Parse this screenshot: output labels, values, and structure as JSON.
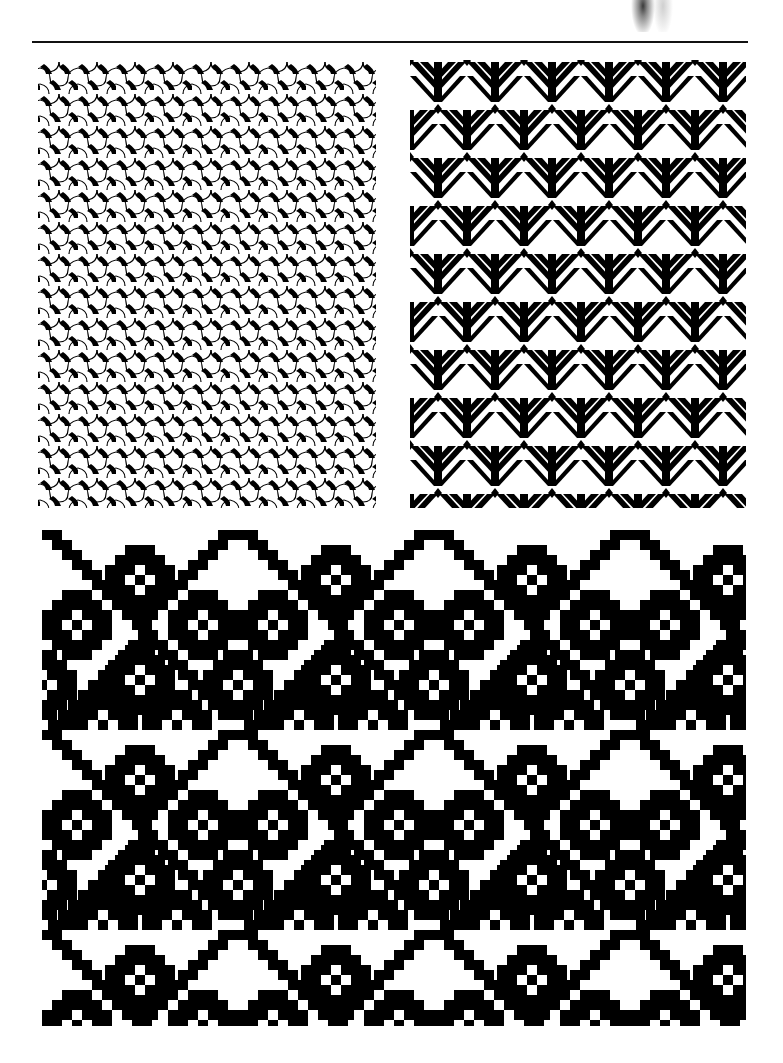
{
  "page": {
    "type": "scanned book page of textile pattern illustrations",
    "background": "#ffffff",
    "ink": "#000000",
    "header_rule": {
      "visible": true
    }
  },
  "panels": [
    {
      "id": "top-left",
      "description": "interlocking three-lobed tile pattern (woven-looking)",
      "position": "top-left"
    },
    {
      "id": "top-right",
      "description": "black geometric tree/chevron motif with diamonds on white",
      "position": "top-right"
    },
    {
      "id": "bottom",
      "description": "pixel-grid diamond lattice with cross-shaped star clusters",
      "position": "bottom-full-width"
    }
  ]
}
